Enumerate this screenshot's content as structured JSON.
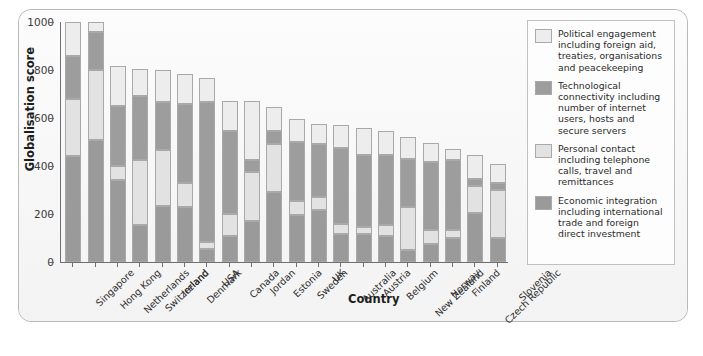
{
  "frame": {
    "background": "#fbfbfb",
    "border_color": "#b9b9b9"
  },
  "axes": {
    "ylabel": "Globalisation score",
    "xlabel": "Country",
    "yticks": [
      0,
      200,
      400,
      600,
      800,
      1000
    ],
    "ytick_labels": [
      "0",
      "200",
      "400",
      "600",
      "800",
      "1000"
    ]
  },
  "legend": {
    "position": "right",
    "entries": [
      {
        "key": "political",
        "color": "#ededed",
        "label": "Political engagement including foreign aid, treaties, organisations and peacekeeping"
      },
      {
        "key": "techno",
        "color": "#9d9d9d",
        "label": "Technological connectivity including number of internet users, hosts and secure servers"
      },
      {
        "key": "personal",
        "color": "#e2e2e2",
        "label": "Personal contact including telephone calls, travel and remittances"
      },
      {
        "key": "economic",
        "color": "#9a9a9a",
        "label": "Economic integration including international trade and foreign direct investment"
      }
    ]
  },
  "chart_data": {
    "type": "bar",
    "subtype": "stacked-vertical",
    "title": "",
    "xlabel": "Country",
    "ylabel": "Globalisation score",
    "ylim": [
      0,
      1000
    ],
    "yticks": [
      0,
      200,
      400,
      600,
      800,
      1000
    ],
    "grid": false,
    "legend_position": "right",
    "stack_order_bottom_to_top": [
      "economic",
      "personal",
      "techno",
      "political"
    ],
    "categories": [
      "Singapore",
      "Hong Kong",
      "Netherlands",
      "Switzerland",
      "Ireland",
      "Denmark",
      "USA",
      "Canada",
      "Jordan",
      "Estonia",
      "Sweden",
      "UK",
      "Australia",
      "Austria",
      "Belgium",
      "New Zealand",
      "Norway",
      "Finland",
      "Czech Republic",
      "Slovenia"
    ],
    "series": [
      {
        "name": "Economic integration including international trade and foreign direct investment",
        "key": "economic",
        "color": "#9a9a9a",
        "values": [
          440,
          510,
          340,
          155,
          235,
          230,
          55,
          110,
          170,
          290,
          195,
          215,
          115,
          115,
          110,
          50,
          75,
          100,
          205,
          100
        ]
      },
      {
        "name": "Personal contact including telephone calls, travel and remittances",
        "key": "personal",
        "color": "#e2e2e2",
        "values": [
          240,
          290,
          60,
          270,
          230,
          100,
          30,
          90,
          205,
          200,
          60,
          55,
          45,
          30,
          45,
          180,
          60,
          35,
          110,
          200
        ]
      },
      {
        "name": "Technological connectivity including number of internet users, hosts and secure servers",
        "key": "techno",
        "color": "#9d9d9d",
        "values": [
          180,
          160,
          250,
          265,
          200,
          330,
          580,
          345,
          50,
          55,
          245,
          220,
          315,
          300,
          290,
          200,
          280,
          290,
          30,
          30
        ]
      },
      {
        "name": "Political engagement including foreign aid, treaties, organisations and peacekeeping",
        "key": "political",
        "color": "#ededed",
        "values": [
          140,
          40,
          165,
          115,
          135,
          125,
          100,
          125,
          245,
          100,
          95,
          85,
          95,
          115,
          100,
          90,
          80,
          45,
          100,
          80
        ]
      }
    ],
    "totals": [
      1000,
      1000,
      815,
      805,
      800,
      785,
      765,
      670,
      670,
      645,
      595,
      575,
      570,
      560,
      545,
      520,
      495,
      470,
      445,
      410
    ]
  }
}
